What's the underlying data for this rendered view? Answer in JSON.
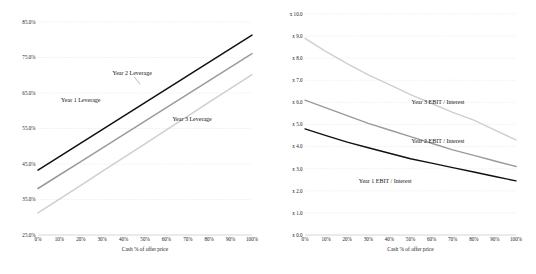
{
  "figure": {
    "background_color": "#ffffff",
    "panel_count": 2
  },
  "colors": {
    "series_year1": "#101010",
    "series_year2": "#9a9a9a",
    "series_year3": "#cfcfcf",
    "gridline": "#d8d8d8",
    "axis": "#b5b5b5",
    "text": "#1d1d1d"
  },
  "chart_data": [
    {
      "type": "line",
      "title": "",
      "xlabel": "Cash % of offer price",
      "ylabel": "",
      "x": [
        0,
        10,
        20,
        30,
        40,
        50,
        60,
        70,
        80,
        90,
        100
      ],
      "categories": [
        "0%",
        "10%",
        "20%",
        "30%",
        "40%",
        "50%",
        "60%",
        "70%",
        "80%",
        "90%",
        "100%"
      ],
      "xtick_labels": [
        "0%",
        "10%",
        "20%",
        "30%",
        "40%",
        "50%",
        "60%",
        "70%",
        "80%",
        "90%",
        "100%"
      ],
      "ytick_labels": [
        "85.0%",
        "75.0%",
        "65.0%",
        "55.0%",
        "45.0%",
        "35.0%",
        "25.0%"
      ],
      "ytick_values": [
        85.0,
        75.0,
        65.0,
        55.0,
        45.0,
        35.0,
        25.0
      ],
      "ylim": [
        25.0,
        85.0
      ],
      "xlim": [
        0,
        100
      ],
      "grid": true,
      "legend_position": "inline-annotations",
      "series": [
        {
          "name": "Year 1 Leverage",
          "color": "#101010",
          "values": [
            43.3,
            47.1,
            50.9,
            54.7,
            58.5,
            62.3,
            66.1,
            69.9,
            73.7,
            77.5,
            81.3
          ]
        },
        {
          "name": "Year 2 Leverage",
          "color": "#9a9a9a",
          "values": [
            38.1,
            41.9,
            45.7,
            49.5,
            53.3,
            57.1,
            60.9,
            64.7,
            68.5,
            72.3,
            76.1
          ]
        },
        {
          "name": "Year 3 Leverage",
          "color": "#cfcfcf",
          "values": [
            31.2,
            35.1,
            39.0,
            42.9,
            46.8,
            50.7,
            54.6,
            58.5,
            62.4,
            66.3,
            70.2
          ]
        }
      ],
      "annotations": [
        {
          "text": "Year 1 Leverage",
          "x": 20,
          "y": 62.5
        },
        {
          "text": "Year 2 Leverage",
          "x": 44,
          "y": 70.0,
          "leader": true
        },
        {
          "text": "Year 3 Leverage",
          "x": 72,
          "y": 57.0
        }
      ]
    },
    {
      "type": "line",
      "title": "",
      "xlabel": "Cash % of offer price",
      "ylabel": "",
      "x": [
        0,
        10,
        20,
        30,
        40,
        50,
        60,
        70,
        80,
        90,
        100
      ],
      "categories": [
        "0%",
        "10%",
        "20%",
        "30%",
        "40%",
        "50%",
        "60%",
        "70%",
        "80%",
        "90%",
        "100%"
      ],
      "xtick_labels": [
        "0%",
        "10%",
        "20%",
        "30%",
        "40%",
        "50%",
        "60%",
        "70%",
        "80%",
        "90%",
        "100%"
      ],
      "ytick_labels": [
        "x 10.0",
        "x 9.0",
        "x 8.0",
        "x 7.0",
        "x 6.0",
        "x 5.0",
        "x 4.0",
        "x 3.0",
        "x 2.0",
        "x 1.0",
        "x 0.0"
      ],
      "ytick_values": [
        10.0,
        9.0,
        8.0,
        7.0,
        6.0,
        5.0,
        4.0,
        3.0,
        2.0,
        1.0,
        0.0
      ],
      "ylim": [
        0.0,
        10.0
      ],
      "xlim": [
        0,
        100
      ],
      "grid": true,
      "legend_position": "inline-annotations",
      "series": [
        {
          "name": "Year 3 EBIT / Interest",
          "color": "#cfcfcf",
          "values": [
            8.9,
            8.3,
            7.75,
            7.25,
            6.8,
            6.35,
            5.95,
            5.55,
            5.2,
            4.75,
            4.3
          ]
        },
        {
          "name": "Year 2 EBIT / Interest",
          "color": "#9a9a9a",
          "values": [
            6.1,
            5.75,
            5.4,
            5.05,
            4.75,
            4.45,
            4.15,
            3.85,
            3.6,
            3.35,
            3.1
          ]
        },
        {
          "name": "Year 1 EBIT / Interest",
          "color": "#101010",
          "values": [
            4.8,
            4.5,
            4.2,
            3.95,
            3.7,
            3.45,
            3.25,
            3.05,
            2.85,
            2.65,
            2.45
          ]
        }
      ],
      "annotations": [
        {
          "text": "Year 3 EBIT / Interest",
          "x": 63,
          "y": 5.95
        },
        {
          "text": "Year 2 EBIT / Interest",
          "x": 63,
          "y": 4.15
        },
        {
          "text": "Year 1 EBIT / Interest",
          "x": 38,
          "y": 2.35
        }
      ]
    }
  ]
}
